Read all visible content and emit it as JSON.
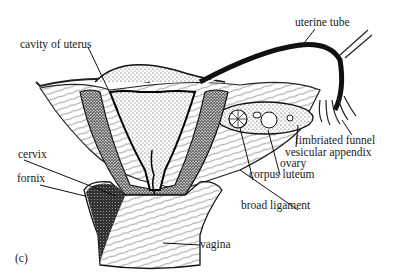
{
  "figure": {
    "panel_label": "(c)",
    "labels": {
      "cavity_of_uterus": "cavity of uterus",
      "uterine_tube": "uterine tube",
      "cervix": "cervix",
      "fornix": "fornix",
      "fimbriated_funnel": "fimbriated funnel",
      "vesicular_appendix": "vesicular appendix",
      "ovary": "ovary",
      "corpus_luteum": "corpus luteum",
      "broad_ligament": "broad ligament",
      "vagina": "vagina"
    }
  }
}
